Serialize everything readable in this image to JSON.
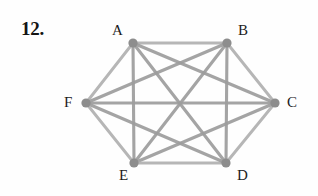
{
  "page": {
    "background_color": "#fefefe",
    "width": 318,
    "height": 196
  },
  "problem": {
    "number_label": "12."
  },
  "figure": {
    "name": "complete-graph-k6",
    "edge_color": "#9d9d9d",
    "vertex_color": "#8d8d8d",
    "label_color": "#1c1c1c",
    "vertices": [
      {
        "id": "A",
        "label": "A",
        "cx": 133,
        "cy": 43,
        "label_x": 112,
        "label_y": 23
      },
      {
        "id": "B",
        "label": "B",
        "cx": 227,
        "cy": 43,
        "label_x": 238,
        "label_y": 23
      },
      {
        "id": "C",
        "label": "C",
        "cx": 275,
        "cy": 103,
        "label_x": 287,
        "label_y": 95
      },
      {
        "id": "D",
        "label": "D",
        "cx": 226,
        "cy": 163,
        "label_x": 237,
        "label_y": 168
      },
      {
        "id": "E",
        "label": "E",
        "cx": 134,
        "cy": 163,
        "label_x": 119,
        "label_y": 168
      },
      {
        "id": "F",
        "label": "F",
        "cx": 86,
        "cy": 103,
        "label_x": 64,
        "label_y": 95
      }
    ],
    "edges": [
      {
        "from": "A",
        "to": "B"
      },
      {
        "from": "A",
        "to": "C"
      },
      {
        "from": "A",
        "to": "D"
      },
      {
        "from": "A",
        "to": "E"
      },
      {
        "from": "A",
        "to": "F"
      },
      {
        "from": "B",
        "to": "C"
      },
      {
        "from": "B",
        "to": "D"
      },
      {
        "from": "B",
        "to": "E"
      },
      {
        "from": "B",
        "to": "F"
      },
      {
        "from": "C",
        "to": "D"
      },
      {
        "from": "C",
        "to": "E"
      },
      {
        "from": "C",
        "to": "F"
      },
      {
        "from": "D",
        "to": "E"
      },
      {
        "from": "D",
        "to": "F"
      },
      {
        "from": "E",
        "to": "F"
      }
    ],
    "vertex_radius": 4.6,
    "edge_count": 15,
    "vertex_count": 6
  }
}
